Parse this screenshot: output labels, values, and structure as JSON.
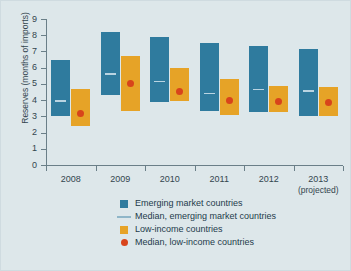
{
  "chart_data": {
    "type": "bar",
    "subtype": "floating-range-bar",
    "title": "",
    "xlabel": "",
    "ylabel": "Reserves (months of imports)",
    "ylim": [
      0,
      9
    ],
    "ytick_labels": [
      "0",
      "1",
      "2",
      "3",
      "4",
      "5",
      "6",
      "7",
      "8",
      "9"
    ],
    "ytick_values": [
      0,
      1,
      2,
      3,
      4,
      5,
      6,
      7,
      8,
      9
    ],
    "grid": false,
    "legend_position": "bottom",
    "categories": [
      "2008",
      "2009",
      "2010",
      "2011",
      "2012",
      "2013"
    ],
    "category_sublabels": [
      "",
      "",
      "",
      "",
      "",
      "(projected)"
    ],
    "series": [
      {
        "name": "Emerging market countries",
        "type": "range-bar",
        "color": "#2f7b9e",
        "low": [
          3.0,
          4.3,
          3.9,
          3.35,
          3.25,
          3.0
        ],
        "high": [
          6.45,
          8.2,
          7.9,
          7.55,
          7.35,
          7.15
        ]
      },
      {
        "name": "Median, emerging market countries",
        "type": "marker-line",
        "color": "#b9d4e2",
        "values": [
          4.0,
          5.65,
          5.2,
          4.45,
          4.7,
          4.6
        ]
      },
      {
        "name": "Low-income countries",
        "type": "range-bar",
        "color": "#e6a327",
        "low": [
          2.4,
          3.35,
          3.95,
          3.1,
          3.25,
          3.05
        ],
        "high": [
          4.7,
          6.75,
          5.95,
          5.3,
          4.85,
          4.8
        ]
      },
      {
        "name": "Median, low-income countries",
        "type": "marker-dot",
        "color": "#d8441b",
        "values": [
          3.15,
          5.0,
          4.55,
          4.0,
          3.9,
          3.85
        ]
      }
    ],
    "legend": [
      {
        "label": "Emerging market countries",
        "marker": "square",
        "color": "#2f7b9e"
      },
      {
        "label": "Median, emerging market countries",
        "marker": "line",
        "color": "#8fb6c8"
      },
      {
        "label": "Low-income countries",
        "marker": "square",
        "color": "#e6a327"
      },
      {
        "label": "Median, low-income countries",
        "marker": "dot",
        "color": "#d8441b"
      }
    ]
  },
  "colors": {
    "background": "#dde7ea",
    "axis": "#6a7f88",
    "text": "#33454e",
    "emerging": "#2f7b9e",
    "emerging_median": "#b9d4e2",
    "lowincome": "#e6a327",
    "lowincome_median": "#d8441b"
  }
}
